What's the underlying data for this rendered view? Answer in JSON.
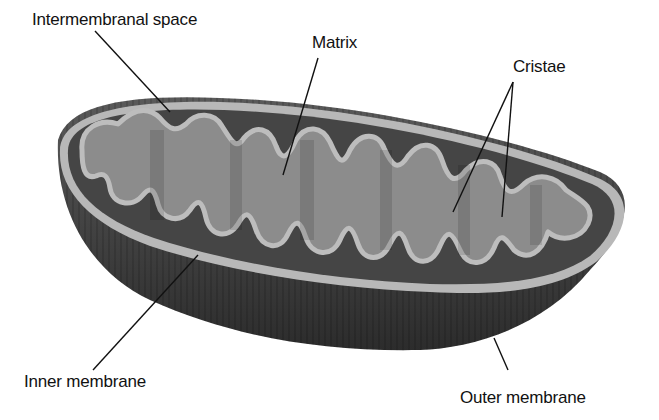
{
  "diagram": {
    "labels": {
      "intermembranal_space": "Intermembranal space",
      "matrix": "Matrix",
      "cristae": "Cristae",
      "inner_membrane": "Inner membrane",
      "outer_membrane": "Outer membrane"
    },
    "colors": {
      "outer_body": "#3a3a3a",
      "intermembrane": "#4d4d4d",
      "membrane": "#b5b5b5",
      "matrix": "#8a8a8a",
      "leader_line": "#111111"
    }
  }
}
